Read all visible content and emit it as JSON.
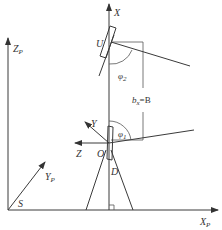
{
  "diagram": {
    "type": "coordinate-frame-geometry",
    "colors": {
      "line": "#3a3a3a",
      "text": "#333333",
      "background": "#ffffff"
    },
    "labels": {
      "x_axis": "X",
      "y_axis": "Y",
      "z_axis": "Z",
      "xp_main": "X",
      "xp_sub": "P",
      "yp_main": "Y",
      "yp_sub": "P",
      "zp_main": "Z",
      "zp_sub": "P",
      "point_u": "U",
      "point_o": "O",
      "point_d": "D",
      "point_s": "S",
      "phi1_main": "φ",
      "phi1_sub": "1",
      "phi2_main": "φ",
      "phi2_sub": "2",
      "bx_main": "b",
      "bx_sub": "x",
      "bx_rest": "=B"
    }
  }
}
